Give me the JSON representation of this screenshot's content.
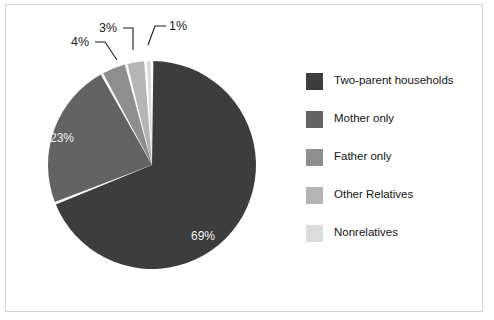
{
  "chart_data": {
    "type": "pie",
    "title": "",
    "subtitle": "",
    "xlabel": "",
    "ylabel": "",
    "legend_position": "right",
    "grid": false,
    "categories": [
      "Two-parent households",
      "Mother only",
      "Father only",
      "Other Relatives",
      "Nonrelatives"
    ],
    "values": [
      69,
      23,
      4,
      3,
      1
    ],
    "value_labels": [
      "69%",
      "23%",
      "4%",
      "3%",
      "1%"
    ],
    "colors": [
      "#3d3d3d",
      "#636363",
      "#8e8e8e",
      "#b5b5b5",
      "#dcdcdc"
    ],
    "slice_separator_color": "#ffffff",
    "label_colors": {
      "inside": "#f2f2f2",
      "outside": "#1a1a1a"
    },
    "label_placement": [
      "inside",
      "inside",
      "outside",
      "outside",
      "outside"
    ],
    "start_angle_deg": 0,
    "direction": "clockwise"
  },
  "figure": {
    "frame_border_color": "#d3d3d3",
    "background_color": "#ffffff"
  },
  "legend": {
    "items": [
      {
        "label": "Two-parent households",
        "color": "#3d3d3d"
      },
      {
        "label": "Mother only",
        "color": "#636363"
      },
      {
        "label": "Father only",
        "color": "#8e8e8e"
      },
      {
        "label": "Other Relatives",
        "color": "#b5b5b5"
      },
      {
        "label": "Nonrelatives",
        "color": "#dcdcdc"
      }
    ]
  },
  "pie_labels": {
    "two_parent": "69%",
    "mother_only": "23%",
    "father_only": "4%",
    "other_relatives": "3%",
    "nonrelatives": "1%"
  }
}
